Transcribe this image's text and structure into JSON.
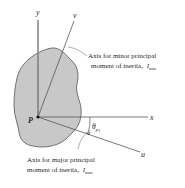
{
  "diagram": {
    "type": "principal-axes-of-inertia",
    "axes": {
      "x": "x",
      "y": "y",
      "u": "u",
      "v": "v"
    },
    "origin_label": "P",
    "angle_label": "θ",
    "angle_subscript": "p",
    "angle_subsubscript": "1",
    "minor_axis_annotation": {
      "line1": "Axis for minor principal",
      "line2": "moment of inertia,",
      "symbol": "I",
      "subscript": "min"
    },
    "major_axis_annotation": {
      "line1": "Axis for major principal",
      "line2": "moment of inertia,",
      "symbol": "I",
      "subscript": "max"
    },
    "colors": {
      "shape_fill": "#c8c8c8",
      "shape_stroke": "#555555",
      "axis": "#555555",
      "text": "#2a2a2a"
    }
  }
}
